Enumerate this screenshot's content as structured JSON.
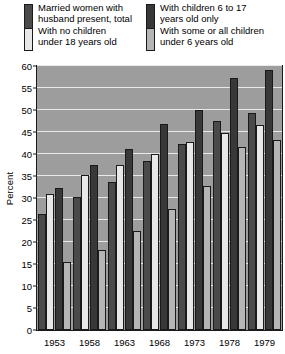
{
  "legend": {
    "columns": [
      {
        "entries": [
          {
            "label_lines": [
              "Married women with",
              "husband present, total"
            ],
            "color": "#4a4a4a",
            "key": "total"
          },
          {
            "label_lines": [
              "With no children",
              "under 18 years old"
            ],
            "color": "#e8e8e8",
            "key": "no_children_under_18"
          }
        ]
      },
      {
        "entries": [
          {
            "label_lines": [
              "With children 6 to 17",
              "years old only"
            ],
            "color": "#383838",
            "key": "children_6_to_17"
          },
          {
            "label_lines": [
              "With some or all children",
              "under 6 years old"
            ],
            "color": "#b5b5b5",
            "key": "children_under_6"
          }
        ]
      }
    ]
  },
  "chart_data": {
    "type": "bar",
    "title": "",
    "xlabel": "",
    "ylabel": "Percent",
    "ylim": [
      0,
      60
    ],
    "ytick_step": 5,
    "yticks": [
      0,
      5,
      10,
      15,
      20,
      25,
      30,
      35,
      40,
      45,
      50,
      55,
      60
    ],
    "categories": [
      "1953",
      "1958",
      "1963",
      "1968",
      "1973",
      "1978",
      "1979"
    ],
    "grid": true,
    "legend_position": "top",
    "plot_background": "#9d9d9d",
    "series": [
      {
        "name": "Married women with husband present, total",
        "color": "#4a4a4a",
        "values": [
          26.3,
          30.2,
          33.7,
          38.3,
          42.2,
          47.6,
          49.4
        ]
      },
      {
        "name": "With no children under 18 years old",
        "color": "#e8e8e8",
        "values": [
          31.0,
          35.2,
          37.4,
          40.1,
          42.8,
          44.7,
          46.7
        ]
      },
      {
        "name": "With children 6 to 17 years old only",
        "color": "#383838",
        "values": [
          32.2,
          37.6,
          41.1,
          46.9,
          50.1,
          57.2,
          59.1
        ]
      },
      {
        "name": "With some or all children under 6 years old",
        "color": "#b5b5b5",
        "values": [
          15.5,
          18.2,
          22.5,
          27.6,
          32.7,
          41.6,
          43.2
        ]
      }
    ]
  }
}
